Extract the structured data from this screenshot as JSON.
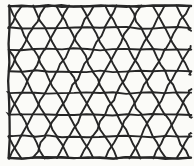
{
  "figure": {
    "name": "triangular-lattice-mesh",
    "medium": "ink on paper",
    "background_color": "#fbfbf8",
    "line_color": "#262626",
    "line_width": 1.9,
    "canvas": {
      "width": 194,
      "height": 166
    }
  },
  "lattice": {
    "type": "triangular",
    "frame": {
      "left": 9,
      "right": 191,
      "top": 6,
      "bottom": 158
    },
    "rows": 7,
    "row_height": 21.7,
    "columns": 8,
    "vertex_pitch": 24.0,
    "horizontal_line_y": [
      6,
      27.7,
      49.4,
      71.1,
      92.9,
      114.6,
      136.3,
      158
    ],
    "wobble_amplitude": 1.2,
    "border_visible": {
      "left": true,
      "top": true,
      "bottom": true,
      "right": false
    }
  },
  "chart_data": {
    "type": "line",
    "xlabel": "",
    "ylabel": "",
    "xlim": [
      9,
      191
    ],
    "ylim": [
      6,
      158
    ],
    "grid": false,
    "legend": "none",
    "annotations": [],
    "series": [
      {
        "name": "horizontal-rails",
        "count": 8,
        "values": [
          6,
          27.7,
          49.4,
          71.1,
          92.9,
          114.6,
          136.3,
          158
        ]
      },
      {
        "name": "diagonal-rising",
        "count": 60,
        "values": []
      },
      {
        "name": "diagonal-falling",
        "count": 60,
        "values": []
      }
    ]
  }
}
